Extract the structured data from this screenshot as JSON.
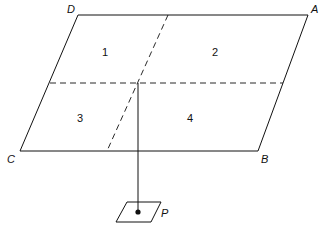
{
  "diagram": {
    "vertices": {
      "D": "D",
      "A": "A",
      "B": "B",
      "C": "C"
    },
    "regions": [
      "1",
      "2",
      "3",
      "4"
    ],
    "point_label": "P",
    "colors": {
      "stroke": "#111111",
      "background": "#ffffff"
    }
  }
}
